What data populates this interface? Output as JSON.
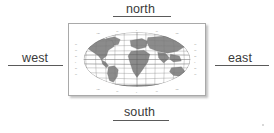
{
  "diagram": {
    "directions": {
      "north": "north",
      "south": "south",
      "west": "west",
      "east": "east"
    },
    "map": {
      "name": "world-map",
      "projection": "elliptical world projection with graticule",
      "graticule_labels": [
        "90",
        "60",
        "30",
        "0",
        "30",
        "60",
        "90"
      ],
      "landmasses": [
        "North America",
        "South America",
        "Europe",
        "Africa",
        "Asia",
        "Australia",
        "Greenland",
        "Antarctica"
      ]
    },
    "colors": {
      "text": "#3a3a3a",
      "rule": "#5a5a5a",
      "land": "#8b8b8b",
      "graticule": "#7e7e7e",
      "frame_border": "#a9a9a9",
      "background": "#ffffff"
    }
  }
}
